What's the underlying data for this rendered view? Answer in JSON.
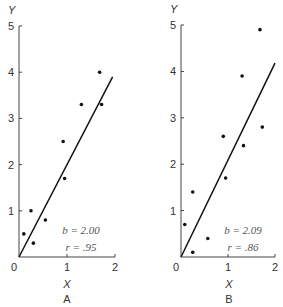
{
  "chart_data": [
    {
      "type": "scatter",
      "panel_label": "A",
      "xlabel": "X",
      "ylabel": "Y",
      "xlim": [
        0,
        2
      ],
      "ylim": [
        0,
        5
      ],
      "x_ticks": [
        "0",
        "1",
        "2"
      ],
      "y_ticks": [
        "1",
        "2",
        "3",
        "4",
        "5"
      ],
      "grid": false,
      "points": [
        {
          "x": 0.1,
          "y": 0.5
        },
        {
          "x": 0.25,
          "y": 1.0
        },
        {
          "x": 0.3,
          "y": 0.3
        },
        {
          "x": 0.55,
          "y": 0.8
        },
        {
          "x": 0.92,
          "y": 2.5
        },
        {
          "x": 0.95,
          "y": 1.7
        },
        {
          "x": 1.3,
          "y": 3.3
        },
        {
          "x": 1.68,
          "y": 4.0
        },
        {
          "x": 1.72,
          "y": 3.3
        }
      ],
      "regression_line": {
        "slope": 2.0,
        "intercept": 0,
        "x_end": 1.95
      },
      "annotations": {
        "b": "b = 2.00",
        "r": "r =   .95"
      }
    },
    {
      "type": "scatter",
      "panel_label": "B",
      "xlabel": "X",
      "ylabel": "Y",
      "xlim": [
        0,
        2
      ],
      "ylim": [
        0,
        5
      ],
      "x_ticks": [
        "0",
        "1",
        "2"
      ],
      "y_ticks": [
        "1",
        "2",
        "3",
        "4",
        "5"
      ],
      "grid": false,
      "points": [
        {
          "x": 0.08,
          "y": 0.7
        },
        {
          "x": 0.25,
          "y": 1.4
        },
        {
          "x": 0.25,
          "y": 0.1
        },
        {
          "x": 0.57,
          "y": 0.4
        },
        {
          "x": 0.9,
          "y": 2.6
        },
        {
          "x": 0.95,
          "y": 1.7
        },
        {
          "x": 1.3,
          "y": 3.9
        },
        {
          "x": 1.33,
          "y": 2.4
        },
        {
          "x": 1.68,
          "y": 4.9
        },
        {
          "x": 1.73,
          "y": 2.8
        }
      ],
      "regression_line": {
        "slope": 2.09,
        "intercept": 0,
        "x_end": 2.0
      },
      "annotations": {
        "b": "b = 2.09",
        "r": "r =   .86"
      }
    }
  ],
  "labels": {
    "origin": "0"
  }
}
